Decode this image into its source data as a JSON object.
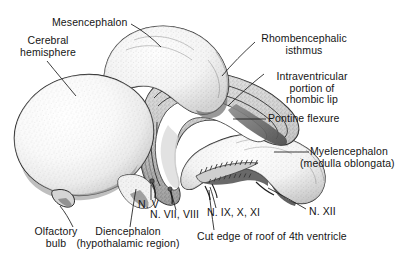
{
  "figure": {
    "background_color": "#ffffff",
    "ink_color": "#151515",
    "width": 411,
    "height": 265
  },
  "labels": {
    "mesencephalon": {
      "text": "Mesencephalon"
    },
    "cerebral_hemisphere": {
      "line1": "Cerebral",
      "line2": "hemisphere"
    },
    "rhombencephalic_isthmus": {
      "line1": "Rhombencephalic",
      "line2": "isthmus"
    },
    "intraventricular_rhombic_lip": {
      "line1": "Intraventricular",
      "line2": "portion of",
      "line3": "rhombic lip"
    },
    "pontine_flexure": {
      "text": "Pontine flexure"
    },
    "myelencephalon": {
      "line1": "Myelencephalon",
      "line2": "(medulla oblongata)"
    },
    "nerve_v": {
      "text": "N. V"
    },
    "nerve_vii_viii": {
      "text": "N. VII, VIII"
    },
    "nerve_ix_x_xi": {
      "text": "N. IX, X, XI"
    },
    "nerve_xii": {
      "text": "N. XII"
    },
    "cut_edge_4th_ventricle": {
      "text": "Cut edge of roof of 4th ventricle"
    },
    "olfactory_bulb": {
      "line1": "Olfactory",
      "line2": "bulb"
    },
    "diencephalon": {
      "line1": "Diencephalon",
      "line2": "(hypothalamic region)"
    }
  },
  "structures": [
    {
      "name": "cerebral-hemisphere",
      "label": "Cerebral hemisphere"
    },
    {
      "name": "mesencephalon",
      "label": "Mesencephalon"
    },
    {
      "name": "rhombencephalic-isthmus",
      "label": "Rhombencephalic isthmus"
    },
    {
      "name": "rhombic-lip",
      "label": "Intraventricular portion of rhombic lip"
    },
    {
      "name": "pontine-flexure",
      "label": "Pontine flexure"
    },
    {
      "name": "myelencephalon",
      "label": "Myelencephalon (medulla oblongata)"
    },
    {
      "name": "olfactory-bulb",
      "label": "Olfactory bulb"
    },
    {
      "name": "diencephalon",
      "label": "Diencephalon (hypothalamic region)"
    },
    {
      "name": "fourth-ventricle-roof",
      "label": "Cut edge of roof of 4th ventricle"
    }
  ],
  "cranial_nerves": [
    {
      "name": "nerve-v",
      "label": "N. V"
    },
    {
      "name": "nerve-vii-viii",
      "label": "N. VII, VIII"
    },
    {
      "name": "nerve-ix-x-xi",
      "label": "N. IX, X, XI"
    },
    {
      "name": "nerve-xii",
      "label": "N. XII"
    }
  ]
}
